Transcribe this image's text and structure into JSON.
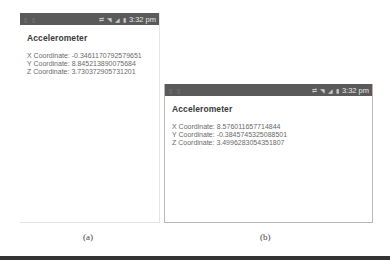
{
  "panels": [
    {
      "statusbar": {
        "time": "3:32 pm",
        "icons": [
          "notification-icon",
          "notification-icon",
          "sync-icon",
          "wifi-icon",
          "signal-icon",
          "battery-icon"
        ]
      },
      "title": "Accelerometer",
      "coordinates": [
        {
          "label": "X Coordinate:",
          "value": "-0.3461170792579651"
        },
        {
          "label": "Y Coordinate:",
          "value": "8.845213890075684"
        },
        {
          "label": "Z Coordinate:",
          "value": "3.730372905731201"
        }
      ],
      "caption": "(a)"
    },
    {
      "statusbar": {
        "time": "3:32 pm",
        "icons": [
          "notification-icon",
          "notification-icon",
          "sync-icon",
          "wifi-icon",
          "signal-icon",
          "battery-icon"
        ]
      },
      "title": "Accelerometer",
      "coordinates": [
        {
          "label": "X Coordinate:",
          "value": "8.576011657714844"
        },
        {
          "label": "Y Coordinate:",
          "value": "-0.3845745325088501"
        },
        {
          "label": "Z Coordinate:",
          "value": "3.4996283054351807"
        }
      ],
      "caption": "(b)"
    }
  ]
}
